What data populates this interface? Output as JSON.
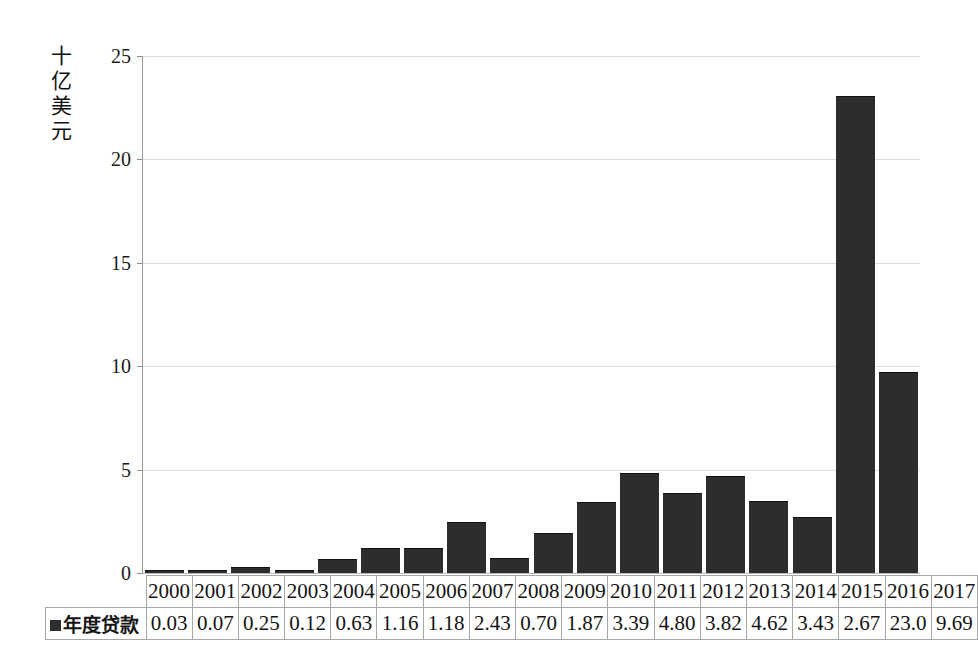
{
  "chart_data": {
    "type": "bar",
    "title": "",
    "subtitle": "",
    "xlabel": "",
    "ylabel": "十亿美元",
    "ylabel_chars": [
      "十",
      "亿",
      "美",
      "元"
    ],
    "categories": [
      "2000",
      "2001",
      "2002",
      "2003",
      "2004",
      "2005",
      "2006",
      "2007",
      "2008",
      "2009",
      "2010",
      "2011",
      "2012",
      "2013",
      "2014",
      "2015",
      "2016",
      "2017"
    ],
    "values": [
      0.03,
      0.07,
      0.25,
      0.12,
      0.63,
      1.16,
      1.18,
      2.43,
      0.7,
      1.87,
      3.39,
      4.8,
      3.82,
      4.62,
      3.43,
      2.67,
      23.0,
      9.69
    ],
    "value_labels": [
      "0.03",
      "0.07",
      "0.25",
      "0.12",
      "0.63",
      "1.16",
      "1.18",
      "2.43",
      "0.70",
      "1.87",
      "3.39",
      "4.80",
      "3.82",
      "4.62",
      "3.43",
      "2.67",
      "23.0",
      "9.69"
    ],
    "series": [
      {
        "name": "年度贷款",
        "color": "#2d2d2d",
        "values": [
          0.03,
          0.07,
          0.25,
          0.12,
          0.63,
          1.16,
          1.18,
          2.43,
          0.7,
          1.87,
          3.39,
          4.8,
          3.82,
          4.62,
          3.43,
          2.67,
          23.0,
          9.69
        ]
      }
    ],
    "ylim": [
      0,
      25
    ],
    "yticks": [
      0,
      5,
      10,
      15,
      20,
      25
    ],
    "ytick_labels": [
      "0",
      "5",
      "10",
      "15",
      "20",
      "25"
    ],
    "grid": true,
    "grid_axis": "y",
    "grid_color": "#dedede",
    "legend": {
      "position": "table-row-left",
      "entries": [
        {
          "label": "年度贷款",
          "marker": "square",
          "color": "#2d2d2d"
        }
      ]
    },
    "data_table": {
      "visible": true,
      "row_label": "年度贷款",
      "header": [
        "2000",
        "2001",
        "2002",
        "2003",
        "2004",
        "2005",
        "2006",
        "2007",
        "2008",
        "2009",
        "2010",
        "2011",
        "2012",
        "2013",
        "2014",
        "2015",
        "2016",
        "2017"
      ],
      "rows": [
        {
          "label": "年度贷款",
          "cells": [
            "0.03",
            "0.07",
            "0.25",
            "0.12",
            "0.63",
            "1.16",
            "1.18",
            "2.43",
            "0.70",
            "1.87",
            "3.39",
            "4.80",
            "3.82",
            "4.62",
            "3.43",
            "2.67",
            "23.0",
            "9.69"
          ]
        }
      ]
    },
    "colors": {
      "bar": "#2d2d2d",
      "grid": "#dedede",
      "axis": "#9a9a9a",
      "table_border": "#a8a8a8",
      "background": "#ffffff",
      "text": "#1a1a1a"
    }
  }
}
